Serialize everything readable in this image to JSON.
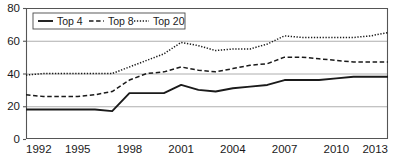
{
  "chart_data": {
    "type": "line",
    "title": "",
    "subtitle": "",
    "xlabel": "",
    "ylabel": "",
    "xlim": [
      1992,
      2013
    ],
    "ylim": [
      0,
      80
    ],
    "grid": true,
    "legend_position": "top-left-inside",
    "x_ticks": [
      "1992",
      "1995",
      "1998",
      "2001",
      "2004",
      "2007",
      "2010",
      "2013"
    ],
    "x_tick_values": [
      1992,
      1995,
      1998,
      2001,
      2004,
      2007,
      2010,
      2013
    ],
    "y_ticks": [
      "0",
      "20",
      "40",
      "60",
      "80"
    ],
    "y_tick_values": [
      0,
      20,
      40,
      60,
      80
    ],
    "x": [
      1992,
      1993,
      1994,
      1995,
      1996,
      1997,
      1998,
      1999,
      2000,
      2001,
      2002,
      2003,
      2004,
      2005,
      2006,
      2007,
      2008,
      2009,
      2010,
      2011,
      2012,
      2013
    ],
    "series": [
      {
        "name": "Top 4",
        "style": "solid",
        "color": "#1a1a1a",
        "values": [
          18,
          18,
          18,
          18,
          18,
          17,
          28,
          28,
          28,
          33,
          30,
          29,
          31,
          32,
          33,
          36,
          36,
          36,
          37,
          38,
          38,
          38
        ]
      },
      {
        "name": "Top 8",
        "style": "dashed",
        "color": "#1a1a1a",
        "values": [
          27,
          26,
          26,
          26,
          27,
          29,
          36,
          40,
          41,
          44,
          42,
          41,
          43,
          45,
          46,
          50,
          50,
          49,
          48,
          47,
          47,
          47
        ]
      },
      {
        "name": "Top 20",
        "style": "dotted",
        "color": "#1a1a1a",
        "values": [
          39,
          40,
          40,
          40,
          40,
          40,
          44,
          48,
          52,
          59,
          57,
          54,
          55,
          55,
          58,
          63,
          62,
          62,
          62,
          62,
          63,
          65
        ]
      }
    ]
  },
  "legend": {
    "items": [
      {
        "label": "Top 4",
        "style": "solid"
      },
      {
        "label": "Top 8",
        "style": "dashed"
      },
      {
        "label": "Top 20",
        "style": "dotted"
      }
    ]
  }
}
